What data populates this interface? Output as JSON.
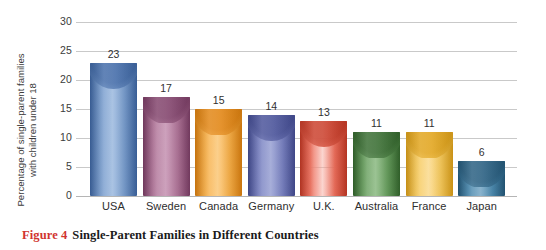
{
  "caption": {
    "figure_number": "Figure 4",
    "title": "Single-Parent Families in Different Countries",
    "number_color": "#d1342f"
  },
  "chart_data": {
    "type": "bar",
    "title": "Single-Parent Families in Different Countries",
    "xlabel": "",
    "ylabel": "Percentage of single-parent families\nwith children under 18",
    "categories": [
      "USA",
      "Sweden",
      "Canada",
      "Germany",
      "U.K.",
      "Australia",
      "France",
      "Japan"
    ],
    "values": [
      23,
      17,
      15,
      14,
      13,
      11,
      11,
      6
    ],
    "value_labels": [
      "23",
      "17",
      "15",
      "14",
      "13",
      "11",
      "11",
      "6"
    ],
    "ylim": [
      0,
      30
    ],
    "yticks": [
      0,
      5,
      10,
      15,
      20,
      25,
      30
    ],
    "ytick_labels": [
      "0",
      "5",
      "10",
      "15",
      "20",
      "25",
      "30"
    ],
    "grid": true,
    "legend": "none",
    "bar_colors": [
      "#6e95c9",
      "#a9648b",
      "#f6a93b",
      "#6f79bd",
      "#ec5f4a",
      "#58934e",
      "#f7c council",
      "#3d7fa6"
    ],
    "series_colors": {
      "usa": "#6e95c9",
      "sweden": "#a9648b",
      "canada": "#f6a93b",
      "germany": "#6f79bd",
      "uk": "#ec5f4a",
      "australia": "#58934e",
      "france": "#f5c košt",
      "japan": "#3d7fa6"
    }
  },
  "axis": {
    "ytick_labels": [
      "30",
      "25",
      "20",
      "15",
      "10",
      "5",
      "0"
    ],
    "y_title_line1": "Percentage of single-parent families",
    "y_title_line2": "with children under 18"
  },
  "bars": [
    {
      "label": "USA",
      "value": 23,
      "value_label": "23",
      "color": "#6e95c9",
      "dark": "#3f68a6",
      "light": "#9fbbdf"
    },
    {
      "label": "Sweden",
      "value": 17,
      "value_label": "17",
      "color": "#ab6c92",
      "dark": "#7e3f68",
      "light": "#c694b3"
    },
    {
      "label": "Canada",
      "value": 15,
      "value_label": "15",
      "color": "#f6a93b",
      "dark": "#e0820f",
      "light": "#fbc97c"
    },
    {
      "label": "Germany",
      "value": 14,
      "value_label": "14",
      "color": "#7079bd",
      "dark": "#454e96",
      "light": "#9ba3d4"
    },
    {
      "label": "U.K.",
      "value": 13,
      "value_label": "13",
      "color": "#ec6450",
      "dark": "#c83a26",
      "light": "#f4958672"
    },
    {
      "label": "Australia",
      "value": 11,
      "value_label": "11",
      "color": "#5c9652",
      "dark": "#35692e",
      "light": "#8ebb85"
    },
    {
      "label": "France",
      "value": 11,
      "value_label": "11",
      "color": "#f6c651",
      "dark": "#e0a218",
      "light": "#fadb91"
    },
    {
      "label": "Japan",
      "value": 6,
      "value_label": "6",
      "color": "#3f81a8",
      "dark": "#255b7d",
      "light": "#7aa9c6"
    }
  ]
}
